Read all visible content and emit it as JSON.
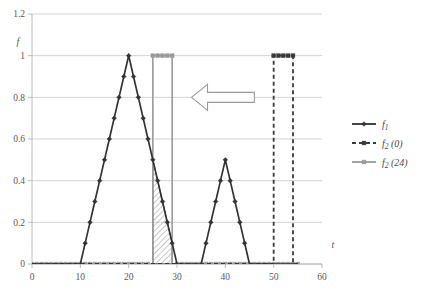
{
  "chart_data": {
    "type": "line",
    "title": "",
    "xlabel": "t",
    "ylabel": "f",
    "xlim": [
      0,
      60
    ],
    "ylim": [
      0,
      1.2
    ],
    "xticks": [
      0,
      10,
      20,
      30,
      40,
      50,
      60
    ],
    "xtick_labels": [
      "0",
      "10",
      "20",
      "30",
      "40",
      "50",
      "60"
    ],
    "yticks": [
      0,
      0.2,
      0.4,
      0.6,
      0.8,
      1,
      1.2
    ],
    "ytick_labels": [
      "0",
      "0.2",
      "0.4",
      "0.6",
      "0.8",
      "1",
      "1.2"
    ],
    "grid": "horizontal",
    "legend_position": "right",
    "series": [
      {
        "name": "f_1",
        "label_main": "f",
        "label_sub": "1",
        "label_arg": "",
        "color": "#333333",
        "style": "solid",
        "marker": "diamond",
        "x": [
          0,
          1,
          2,
          3,
          4,
          5,
          6,
          7,
          8,
          9,
          10,
          11,
          12,
          13,
          14,
          15,
          16,
          17,
          18,
          19,
          20,
          21,
          22,
          23,
          24,
          25,
          26,
          27,
          28,
          29,
          30,
          31,
          32,
          33,
          34,
          35,
          36,
          37,
          38,
          39,
          40,
          41,
          42,
          43,
          44,
          45,
          46,
          47,
          48,
          49,
          50,
          51,
          52,
          53,
          54,
          55
        ],
        "y": [
          0,
          0,
          0,
          0,
          0,
          0,
          0,
          0,
          0,
          0,
          0,
          0.1,
          0.2,
          0.3,
          0.4,
          0.5,
          0.6,
          0.7,
          0.8,
          0.9,
          1,
          0.9,
          0.8,
          0.7,
          0.6,
          0.5,
          0.4,
          0.3,
          0.2,
          0.1,
          0,
          0,
          0,
          0,
          0,
          0,
          0.1,
          0.2,
          0.3,
          0.4,
          0.5,
          0.4,
          0.3,
          0.2,
          0.1,
          0,
          0,
          0,
          0,
          0,
          0,
          0,
          0,
          0,
          0,
          0
        ]
      },
      {
        "name": "f_2(0)",
        "label_main": "f",
        "label_sub": "2",
        "label_arg": "(0)",
        "color": "#3a3a3a",
        "style": "dashed",
        "marker": "square",
        "x": [
          0,
          49,
          50,
          50,
          54,
          54,
          55
        ],
        "y": [
          0,
          0,
          0,
          1,
          1,
          0,
          0
        ],
        "pulse_start": 50,
        "pulse_end": 54,
        "pulse_height": 1
      },
      {
        "name": "f_2(24)",
        "label_main": "f",
        "label_sub": "2",
        "label_arg": "(24)",
        "color": "#9a9a9a",
        "style": "solid",
        "marker": "square",
        "x": [
          0,
          24,
          25,
          25,
          29,
          29,
          55
        ],
        "y": [
          0,
          0,
          0,
          1,
          1,
          0,
          0
        ],
        "pulse_start": 25,
        "pulse_end": 29,
        "pulse_height": 1
      }
    ],
    "annotations": [
      {
        "name": "shaded-overlap-region",
        "type": "hatched-area",
        "description": "hatched triangular overlap between f_1 descending edge and f_2(24) pulse",
        "x_start": 25,
        "x_end": 29,
        "y_top_start": 0.5,
        "y_top_end": 0.1
      },
      {
        "name": "left-arrow",
        "type": "arrow",
        "direction": "left",
        "x_tail": 46,
        "x_head": 33,
        "y": 0.8
      }
    ]
  },
  "legend": {
    "items": [
      {
        "main": "f",
        "sub": "1",
        "arg": ""
      },
      {
        "main": "f",
        "sub": "2",
        "arg": "(0)"
      },
      {
        "main": "f",
        "sub": "2",
        "arg": "(24)"
      }
    ]
  },
  "axes": {
    "x_title": "t",
    "y_title": "f"
  }
}
